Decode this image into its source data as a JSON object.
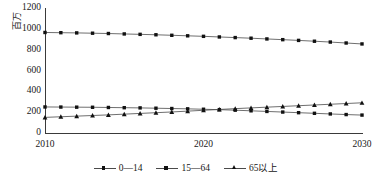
{
  "chart_data": {
    "type": "line",
    "title": "",
    "xlabel": "",
    "ylabel": "百万",
    "xlim": [
      2010,
      2030
    ],
    "ylim": [
      0,
      1200
    ],
    "yticks": [
      0,
      200,
      400,
      600,
      800,
      1000,
      1200
    ],
    "xticks": [
      2010,
      2020,
      2030
    ],
    "xtick_labels": [
      "2010",
      "2020",
      "2030"
    ],
    "ytick_labels": [
      "0",
      "200",
      "400",
      "600",
      "800",
      "1000",
      "1200"
    ],
    "grid": false,
    "legend_position": "bottom",
    "x": [
      2010,
      2011,
      2012,
      2013,
      2014,
      2015,
      2016,
      2017,
      2018,
      2019,
      2020,
      2021,
      2022,
      2023,
      2024,
      2025,
      2026,
      2027,
      2028,
      2029,
      2030
    ],
    "series": [
      {
        "name": "0—14",
        "marker": "square",
        "color": "#111111",
        "values": [
          250,
          249,
          248,
          247,
          245,
          243,
          241,
          238,
          235,
          232,
          228,
          224,
          219,
          213,
          207,
          201,
          195,
          189,
          183,
          177,
          172
        ]
      },
      {
        "name": "15—64",
        "marker": "square",
        "color": "#111111",
        "values": [
          965,
          963,
          961,
          958,
          955,
          951,
          947,
          943,
          938,
          933,
          928,
          922,
          916,
          910,
          903,
          896,
          889,
          881,
          873,
          864,
          855
        ]
      },
      {
        "name": "65以上",
        "marker": "triangle",
        "color": "#111111",
        "values": [
          150,
          156,
          162,
          168,
          174,
          181,
          188,
          195,
          202,
          210,
          218,
          226,
          234,
          241,
          248,
          255,
          262,
          269,
          276,
          283,
          290
        ]
      }
    ]
  },
  "axis": {
    "y_title": "百万"
  },
  "legend": {
    "items": [
      {
        "label": "0—14"
      },
      {
        "label": "15—64"
      },
      {
        "label": "65以上"
      }
    ]
  }
}
